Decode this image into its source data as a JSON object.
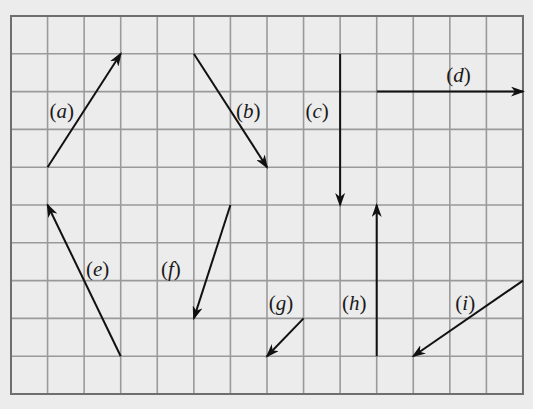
{
  "diagram": {
    "type": "vector-grid",
    "grid": {
      "columns": 14,
      "rows": 10,
      "origin_px": [
        11,
        16
      ],
      "cell_width_px": 36.57,
      "cell_height_px": 37.8,
      "line_color": "#9a9a9a",
      "border_color": "#6e6e6e",
      "background": "#ececec"
    },
    "arrow_color": "#111111",
    "vectors": [
      {
        "id": "a",
        "label": "a",
        "from": [
          1,
          4
        ],
        "to": [
          3,
          1
        ],
        "label_pos": [
          1.05,
          2.5
        ]
      },
      {
        "id": "b",
        "label": "b",
        "from": [
          5,
          1
        ],
        "to": [
          7,
          4
        ],
        "label_pos": [
          6.15,
          2.5
        ]
      },
      {
        "id": "c",
        "label": "c",
        "from": [
          9,
          1
        ],
        "to": [
          9,
          5
        ],
        "label_pos": [
          8.05,
          2.5
        ]
      },
      {
        "id": "d",
        "label": "d",
        "from": [
          10,
          2
        ],
        "to": [
          14,
          2
        ],
        "label_pos": [
          11.9,
          1.55
        ]
      },
      {
        "id": "e",
        "label": "e",
        "from": [
          3,
          9
        ],
        "to": [
          1,
          5
        ],
        "label_pos": [
          2.05,
          6.7
        ]
      },
      {
        "id": "f",
        "label": "f",
        "from": [
          6,
          5
        ],
        "to": [
          5,
          8
        ],
        "label_pos": [
          4.1,
          6.7
        ]
      },
      {
        "id": "g",
        "label": "g",
        "from": [
          8,
          8
        ],
        "to": [
          7,
          9
        ],
        "label_pos": [
          7.05,
          7.6
        ]
      },
      {
        "id": "h",
        "label": "h",
        "from": [
          10,
          9
        ],
        "to": [
          10,
          5
        ],
        "label_pos": [
          9.05,
          7.6
        ]
      },
      {
        "id": "i",
        "label": "i",
        "from": [
          14,
          7
        ],
        "to": [
          11,
          9
        ],
        "label_pos": [
          12.15,
          7.6
        ]
      }
    ]
  }
}
